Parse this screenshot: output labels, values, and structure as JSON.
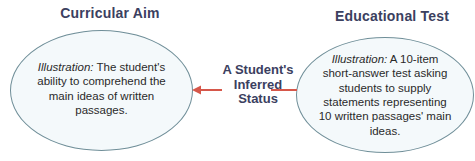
{
  "diagram": {
    "left": {
      "heading": "Curricular Aim",
      "illustration_label": "Illustration:",
      "illustration_text": " The student's ability to comprehend the main ideas of written passages."
    },
    "right": {
      "heading": "Educational Test",
      "illustration_label": "Illustration:",
      "illustration_text": " A 10-item short-answer test asking students to supply statements representing 10 written passages' main ideas."
    },
    "center": {
      "label_line1": "A Student's",
      "label_line2": "Inferred",
      "label_line3": "Status"
    },
    "colors": {
      "heading": "#3b4060",
      "ellipse_stroke": "#6f8e98",
      "ellipse_fill": "#f4f9fb",
      "arrow": "#d6574a"
    },
    "arrows": [
      {
        "from": "center",
        "to": "left",
        "type": "arrowhead",
        "direction": "left"
      },
      {
        "from": "right",
        "to": "center",
        "type": "line"
      }
    ]
  }
}
